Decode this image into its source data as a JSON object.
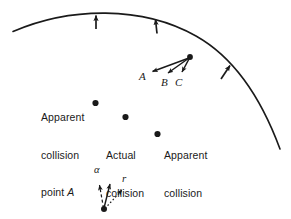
{
  "figure": {
    "stroke_color": "#1a1a1a",
    "background_color": "#ffffff",
    "arc": {
      "name": "curved-boundary-arc",
      "normal_arrow_count": 3
    },
    "annotations": {
      "apparent_a": {
        "line1": "Apparent",
        "line2": "collision",
        "line3_prefix": "point ",
        "line3_italic": "A"
      },
      "actual": {
        "line1": "Actual",
        "line2": "collision",
        "line3": "point"
      },
      "apparent_c": {
        "line1": "Apparent",
        "line2": "collision",
        "line3_prefix": "point ",
        "line3_italic": "C"
      }
    },
    "vector_fan": {
      "label_a": "A",
      "label_b": "B",
      "label_c": "C"
    },
    "vector_inset": {
      "label_alpha": "α",
      "label_r": "r"
    }
  }
}
